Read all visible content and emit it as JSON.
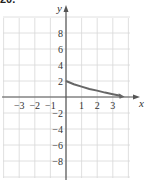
{
  "figure": {
    "label": "20."
  },
  "chart_data": {
    "type": "line",
    "title": "",
    "xlabel": "x",
    "ylabel": "y",
    "xlim": [
      -4,
      4
    ],
    "ylim": [
      -10,
      10
    ],
    "grid": true,
    "x_ticks": [
      -3,
      -2,
      -1,
      1,
      2,
      3
    ],
    "x_tick_labels": [
      "−3",
      "−2",
      "−1",
      "1",
      "2",
      "3"
    ],
    "y_ticks": [
      8,
      6,
      4,
      2,
      -2,
      -4,
      -6,
      -8
    ],
    "y_tick_labels": [
      "8",
      "6",
      "4",
      "2",
      "−2",
      "−4",
      "−6",
      "−8"
    ],
    "series": [
      {
        "name": "f(x)",
        "x": [
          0,
          0.5,
          1,
          1.5,
          2,
          2.5,
          3,
          3.5
        ],
        "y": [
          2,
          1.6,
          1.3,
          1.0,
          0.8,
          0.55,
          0.35,
          0.15
        ]
      }
    ],
    "colors": {
      "curve": "#666666",
      "axis": "#555555",
      "grid": "#d8d8d8"
    }
  }
}
